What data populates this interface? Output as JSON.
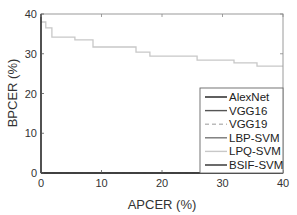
{
  "chart_data": {
    "type": "line",
    "title": "",
    "xlabel": "APCER (%)",
    "ylabel": "BPCER (%)",
    "xlim": [
      0,
      40
    ],
    "ylim": [
      0,
      40
    ],
    "xticks": [
      0,
      10,
      20,
      30,
      40
    ],
    "yticks": [
      0,
      10,
      20,
      30,
      40
    ],
    "grid": false,
    "legend_position": "lower right",
    "series": [
      {
        "name": "AlexNet",
        "color": "#1a1a1a",
        "style": "solid",
        "x": [
          0,
          40
        ],
        "y": [
          0,
          0
        ]
      },
      {
        "name": "VGG16",
        "color": "#555555",
        "style": "solid",
        "x": [
          0,
          40
        ],
        "y": [
          0,
          0
        ]
      },
      {
        "name": "VGG19",
        "color": "#bbbbbb",
        "style": "dashed",
        "x": [
          0,
          40
        ],
        "y": [
          0,
          0
        ]
      },
      {
        "name": "LBP-SVM",
        "color": "#777777",
        "style": "solid",
        "x": [
          0,
          40
        ],
        "y": [
          0,
          0
        ]
      },
      {
        "name": "LPQ-SVM",
        "color": "#c8c8c8",
        "style": "solid",
        "x": [
          0,
          0.8,
          0.8,
          1.8,
          1.8,
          5.6,
          5.6,
          8.6,
          8.6,
          15.7,
          15.7,
          18.0,
          18.0,
          25.8,
          25.8,
          31.9,
          31.9,
          35.7,
          35.7,
          40
        ],
        "y": [
          38.0,
          38.0,
          36.5,
          36.5,
          34.2,
          34.2,
          33.5,
          33.5,
          31.7,
          31.7,
          30.4,
          30.4,
          29.4,
          29.4,
          28.4,
          28.4,
          27.7,
          27.7,
          26.9,
          26.9
        ]
      },
      {
        "name": "BSIF-SVM",
        "color": "#2b2b2b",
        "style": "solid",
        "x": [
          0,
          40
        ],
        "y": [
          0,
          0
        ]
      }
    ]
  },
  "axes": {
    "x_label": "APCER (%)",
    "y_label": "BPCER (%)",
    "x_tick_labels": [
      "0",
      "10",
      "20",
      "30",
      "40"
    ],
    "y_tick_labels": [
      "0",
      "10",
      "20",
      "30",
      "40"
    ]
  },
  "legend": {
    "items": [
      {
        "label": "AlexNet",
        "color": "#1a1a1a",
        "dash": ""
      },
      {
        "label": "VGG16",
        "color": "#555555",
        "dash": ""
      },
      {
        "label": "VGG19",
        "color": "#bbbbbb",
        "dash": "4,3"
      },
      {
        "label": "LBP-SVM",
        "color": "#777777",
        "dash": ""
      },
      {
        "label": "LPQ-SVM",
        "color": "#c8c8c8",
        "dash": ""
      },
      {
        "label": "BSIF-SVM",
        "color": "#2b2b2b",
        "dash": ""
      }
    ]
  }
}
